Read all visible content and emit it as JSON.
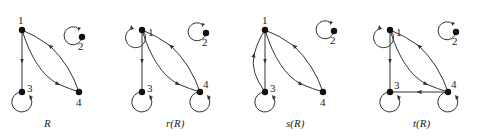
{
  "figure": {
    "background": "#ffffff",
    "ink_color": "#222222",
    "graphs": [
      {
        "id": "R",
        "caption": "R",
        "nodes": {
          "1": "1",
          "2": "2",
          "3": "3",
          "4": "4"
        },
        "edges": [
          "1->3",
          "1->4",
          "4->1",
          "2->2",
          "3->3"
        ]
      },
      {
        "id": "rR",
        "caption": "r(R)",
        "nodes": {
          "1": "1",
          "2": "2",
          "3": "3",
          "4": "4"
        },
        "edges": [
          "1->1",
          "1->3",
          "1->4",
          "4->1",
          "2->2",
          "3->3",
          "4->4"
        ]
      },
      {
        "id": "sR",
        "caption": "s(R)",
        "nodes": {
          "1": "1",
          "2": "2",
          "3": "3",
          "4": "4"
        },
        "edges": [
          "1->3",
          "3->1",
          "1->4",
          "4->1",
          "2->2",
          "3->3"
        ]
      },
      {
        "id": "tR",
        "caption": "t(R)",
        "nodes": {
          "1": "1",
          "2": "2",
          "3": "3",
          "4": "4"
        },
        "edges": [
          "1->1",
          "1->3",
          "1->4",
          "4->1",
          "4->3",
          "2->2",
          "3->3",
          "4->4"
        ]
      }
    ]
  }
}
